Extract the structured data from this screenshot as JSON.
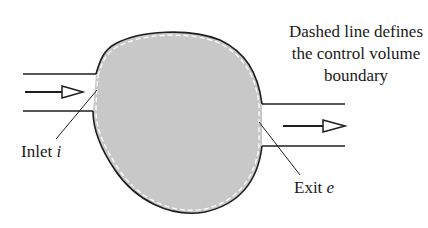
{
  "diagram": {
    "caption": {
      "line1": "Dashed line defines",
      "line2": "the control volume",
      "line3": "boundary"
    },
    "inlet_label": {
      "text": "Inlet ",
      "symbol": "i"
    },
    "exit_label": {
      "text": "Exit ",
      "symbol": "e"
    },
    "colors": {
      "fill": "#c8c8c8",
      "stroke": "#1e1e1e",
      "dash": "#ffffff",
      "background": "#ffffff"
    }
  }
}
